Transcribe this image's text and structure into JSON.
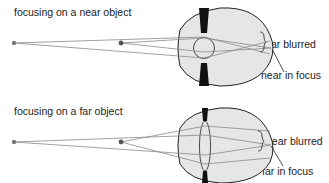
{
  "panels": [
    {
      "title": "focusing on a near object",
      "labels": {
        "top": "far blurred",
        "bottom": "near in focus"
      },
      "lens": "thick"
    },
    {
      "title": "focusing on a far object",
      "labels": {
        "top": "near blurred",
        "bottom": "far in focus"
      },
      "lens": "thin"
    }
  ],
  "colors": {
    "eye_fill": "#e6e6e6",
    "outline": "#222222",
    "ray": "#8a8a8a",
    "iris": "#111111",
    "point": "#666666"
  }
}
